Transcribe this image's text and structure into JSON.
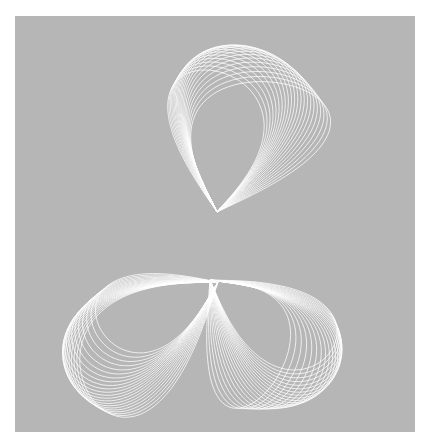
{
  "artwork": {
    "title": "",
    "background_color": "#b6b6b6",
    "stroke_color": "#ffffff",
    "frame": {
      "x": 15,
      "y": 16,
      "width": 400,
      "height": 416
    },
    "description": "Generative line art: three lobes of overlapping white loop curves converging at a central twisted pinch",
    "lobes": [
      {
        "name": "top-lobe",
        "anchor": [
          217,
          212
        ],
        "tip": [
          215,
          40
        ],
        "spread": 75,
        "rotation": -8,
        "count": 22,
        "shift": [
          3.2,
          0.6
        ]
      },
      {
        "name": "lower-left-lobe",
        "anchor": [
          218,
          282
        ],
        "tip": [
          75,
          340
        ],
        "spread": 62,
        "rotation": 5,
        "count": 22,
        "shift": [
          -0.6,
          3.0
        ]
      },
      {
        "name": "lower-right-lobe",
        "anchor": [
          210,
          280
        ],
        "tip": [
          355,
          370
        ],
        "spread": 62,
        "rotation": -5,
        "count": 22,
        "shift": [
          -2.8,
          1.6
        ]
      }
    ]
  }
}
